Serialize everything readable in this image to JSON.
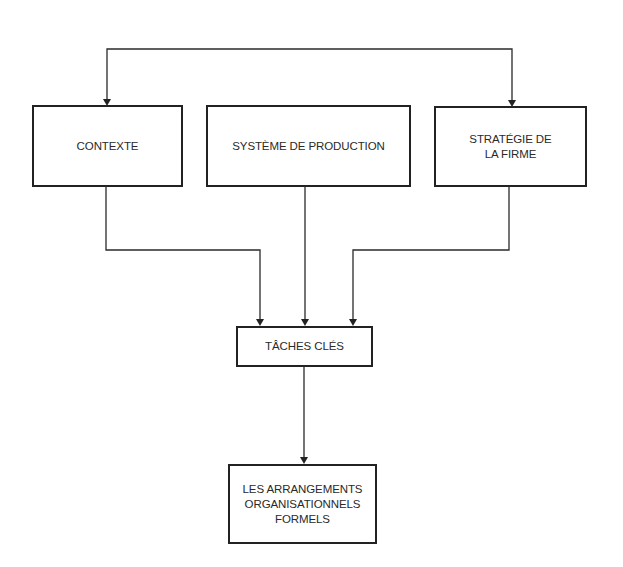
{
  "diagram": {
    "type": "flowchart",
    "nodes": [
      {
        "id": "contexte",
        "label": "CONTEXTE"
      },
      {
        "id": "systeme",
        "label": "SYSTÈME DE PRODUCTION"
      },
      {
        "id": "strategie",
        "label": "STRATÉGIE DE\nLA FIRME"
      },
      {
        "id": "taches",
        "label": "TÂCHES CLÉS"
      },
      {
        "id": "arrangements",
        "label": "LES ARRANGEMENTS\nORGANISATIONNELS\nFORMELS"
      }
    ],
    "edges": [
      {
        "from": "contexte",
        "to": "strategie",
        "note": "top loop connector"
      },
      {
        "from": "strategie",
        "to": "contexte",
        "note": "top loop connector"
      },
      {
        "from": "contexte",
        "to": "taches"
      },
      {
        "from": "systeme",
        "to": "taches"
      },
      {
        "from": "strategie",
        "to": "taches"
      },
      {
        "from": "taches",
        "to": "arrangements"
      }
    ],
    "colors": {
      "line": "#2a2a2a",
      "background": "#ffffff"
    }
  }
}
